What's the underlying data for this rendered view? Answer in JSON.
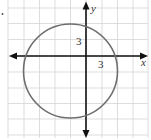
{
  "figure": {
    "type": "coordinate-graph",
    "grid": {
      "vertical_lines_x": [
        8,
        24,
        39.5,
        55,
        70.5,
        86,
        102,
        117.5,
        133,
        148
      ],
      "horizontal_lines_y": [
        8,
        23.5,
        39.5,
        56,
        72,
        88,
        103.5,
        119,
        135
      ],
      "units_per_cell": 3
    },
    "axes": {
      "origin_px": [
        86,
        56
      ],
      "x_label": "x",
      "y_label": "y",
      "x_tick_label": "3",
      "y_tick_label": "3"
    },
    "circle": {
      "center_units": [
        -3,
        -3
      ],
      "radius_units": 9,
      "center_px": [
        70.5,
        71
      ],
      "radius_px": 47,
      "stroke_color": "#6e6e6e"
    },
    "colors": {
      "grid": "#d4d4d4",
      "axis": "#111111",
      "background": "#ffffff"
    }
  }
}
